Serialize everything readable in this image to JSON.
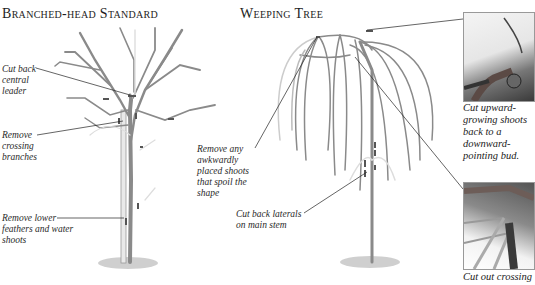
{
  "sections": [
    {
      "title": "Branched-head Standard",
      "labels": [
        {
          "text_lines": [
            "Cut back",
            "central",
            "leader"
          ]
        },
        {
          "text_lines": [
            "Remove",
            "crossing",
            "branches"
          ]
        },
        {
          "text_lines": [
            "Remove lower",
            "feathers and water",
            "shoots"
          ]
        }
      ]
    },
    {
      "title": "Weeping Tree",
      "labels": [
        {
          "text_lines": [
            "Remove any",
            "awkwardly",
            "placed shoots",
            "that spoil the",
            "shape"
          ]
        },
        {
          "text_lines": [
            "Cut back laterals",
            "on main stem"
          ]
        }
      ]
    }
  ],
  "photos": [
    {
      "caption_lines": [
        "Cut upward-",
        "growing shoots",
        "back to a",
        "downward-",
        "pointing bud."
      ]
    },
    {
      "caption_lines": [
        "Cut out crossing"
      ]
    }
  ],
  "colors": {
    "branch": "#8a8a8a",
    "branch_dark": "#5a5a5a",
    "cut_mark": "#555555",
    "leader_line": "#222222"
  }
}
